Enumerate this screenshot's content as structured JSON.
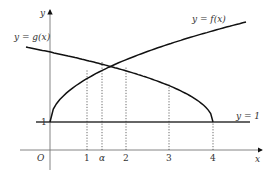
{
  "diagram": {
    "axes": {
      "x_label": "x",
      "y_label": "y",
      "origin_label": "O"
    },
    "x_ticks": [
      {
        "value": 1,
        "label": "1"
      },
      {
        "value": 1.35,
        "label": "α"
      },
      {
        "value": 2,
        "label": "2"
      },
      {
        "value": 3,
        "label": "3"
      },
      {
        "value": 4,
        "label": "4"
      }
    ],
    "y_tick": {
      "value": 1,
      "label": "1"
    },
    "curves": {
      "f": {
        "label": "y = f(x)"
      },
      "g": {
        "label": "y = g(x)"
      },
      "line": {
        "label": "y = 1"
      }
    },
    "colors": {
      "curve": "#111111",
      "axis": "#555555",
      "guide": "#444444"
    }
  }
}
